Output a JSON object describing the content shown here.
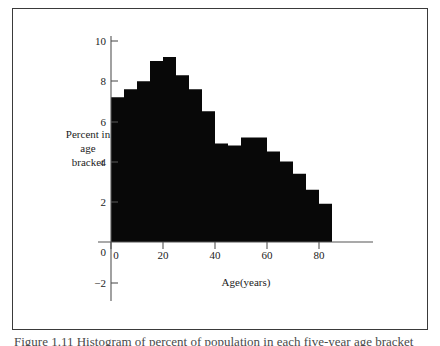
{
  "figure": {
    "caption_fragment": "Figure 1.11   Histogram of percent of population in each five-year age bracket"
  },
  "chart_data": {
    "type": "bar",
    "title": "",
    "subtitle": "",
    "xlabel": "Age(years)",
    "ylabel": "Percent in age bracket",
    "ylabel_lines": [
      "Percent in",
      "age",
      "bracket"
    ],
    "xlim": [
      0,
      85
    ],
    "ylim": [
      -2,
      10
    ],
    "grid": false,
    "legend": null,
    "bar_width": 5,
    "x_ticks": [
      0,
      20,
      40,
      60,
      80
    ],
    "x_tick_labels": [
      "0",
      "20",
      "40",
      "60",
      "80"
    ],
    "y_ticks": [
      -2,
      2,
      4,
      6,
      8,
      10
    ],
    "y_tick_labels": [
      "−2",
      "2",
      "4",
      "6",
      "8",
      "10"
    ],
    "origin_label": "0",
    "bar_color": "#080808",
    "axis_color": "#555555",
    "categories": [
      "0-5",
      "5-10",
      "10-15",
      "15-20",
      "20-25",
      "25-30",
      "30-35",
      "35-40",
      "40-45",
      "45-50",
      "50-55",
      "55-60",
      "60-65",
      "65-70",
      "70-75",
      "75-80",
      "80-85"
    ],
    "bin_edges": [
      0,
      5,
      10,
      15,
      20,
      25,
      30,
      35,
      40,
      45,
      50,
      55,
      60,
      65,
      70,
      75,
      80,
      85
    ],
    "values": [
      7.2,
      7.6,
      8.0,
      9.0,
      9.2,
      8.3,
      7.6,
      6.5,
      4.9,
      4.8,
      5.2,
      5.2,
      4.5,
      4.0,
      3.4,
      2.6,
      1.9
    ]
  }
}
